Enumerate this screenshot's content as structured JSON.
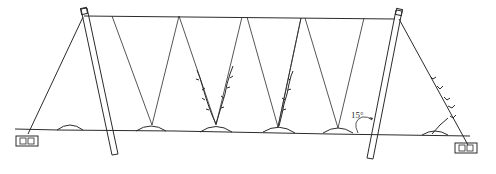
{
  "diagram": {
    "type": "trellis-side-view",
    "annotation": {
      "angle_label": "15°"
    },
    "colors": {
      "line": "#2b2b2b",
      "background": "#ffffff"
    },
    "elements": {
      "posts": 2,
      "anchor_blocks": 2,
      "mounds": 7,
      "v_strings": 5,
      "vines": 4
    }
  }
}
